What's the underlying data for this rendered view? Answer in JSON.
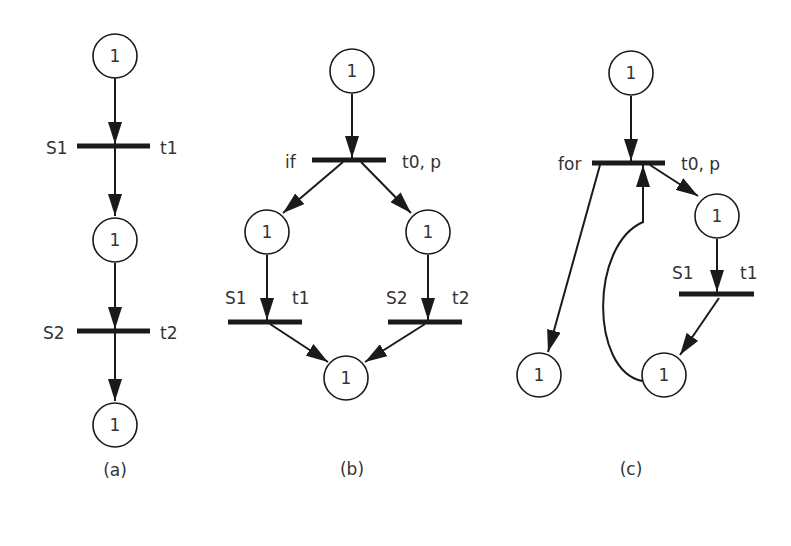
{
  "figure": {
    "panels": [
      {
        "caption": "(a)",
        "places": [
          {
            "token": "1"
          },
          {
            "token": "1"
          },
          {
            "token": "1"
          }
        ],
        "transitions": [
          {
            "left_label": "S1",
            "right_label": "t1"
          },
          {
            "left_label": "S2",
            "right_label": "t2"
          }
        ]
      },
      {
        "caption": "(b)",
        "places": [
          {
            "token": "1"
          },
          {
            "token": "1"
          },
          {
            "token": "1"
          },
          {
            "token": "1"
          }
        ],
        "transitions": [
          {
            "left_label": "if",
            "right_label": "t0, p"
          },
          {
            "left_label": "S1",
            "right_label": "t1"
          },
          {
            "left_label": "S2",
            "right_label": "t2"
          }
        ]
      },
      {
        "caption": "(c)",
        "places": [
          {
            "token": "1"
          },
          {
            "token": "1"
          },
          {
            "token": "1"
          },
          {
            "token": "1"
          }
        ],
        "transitions": [
          {
            "left_label": "for",
            "right_label": "t0, p"
          },
          {
            "left_label": "S1",
            "right_label": "t1"
          }
        ]
      }
    ],
    "colors": {
      "stroke": "#1a1a1a",
      "text": "#333333",
      "background": "#ffffff"
    }
  }
}
